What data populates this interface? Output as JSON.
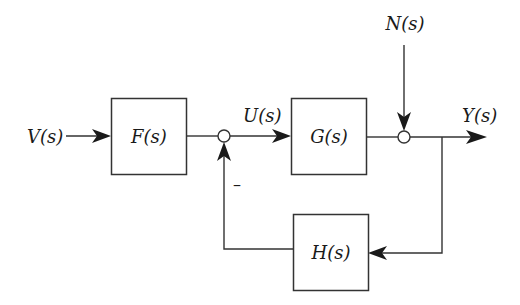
{
  "diagram": {
    "type": "block-diagram",
    "signals": {
      "input": "V(s)",
      "control": "U(s)",
      "disturbance": "N(s)",
      "output": "Y(s)"
    },
    "blocks": [
      {
        "id": "F",
        "label": "F(s)"
      },
      {
        "id": "G",
        "label": "G(s)"
      },
      {
        "id": "H",
        "label": "H(s)"
      }
    ],
    "summing_junctions": [
      {
        "id": "sum1",
        "inputs": [
          "F(s) output (+)",
          "H(s) output (−)"
        ],
        "sign_label": "−"
      },
      {
        "id": "sum2",
        "inputs": [
          "G(s) output (+)",
          "N(s) (+)"
        ]
      }
    ],
    "connections": [
      "V(s) → F(s)",
      "F(s) → sum1",
      "sum1 → G(s) [U(s)]",
      "G(s) → sum2",
      "N(s) → sum2",
      "sum2 → Y(s)",
      "Y(s) → H(s)",
      "H(s) → sum1 (negative)"
    ]
  },
  "labels": {
    "V": "V(s)",
    "F": "F(s)",
    "U": "U(s)",
    "G": "G(s)",
    "N": "N(s)",
    "Y": "Y(s)",
    "H": "H(s)",
    "minus": "–"
  }
}
